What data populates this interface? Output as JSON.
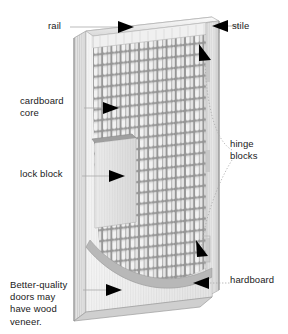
{
  "diagram": {
    "view": "three-quarter perspective cutaway"
  },
  "labels": {
    "rail": "rail",
    "stile": "stile",
    "cardboard_core": "cardboard\ncore",
    "lock_block": "lock block",
    "hinge_blocks": "hinge\nblocks",
    "hardboard": "hardboard",
    "veneer_note": "Better-quality\ndoors may\nhave wood\nveneer."
  },
  "colors": {
    "background": "#ffffff",
    "text": "#1a1a1a",
    "leader_line": "#a9a9a9",
    "arrow": "#000000",
    "face_light": "#f2f2f2",
    "face_mid": "#dcdcdc",
    "face_shadow": "#b9b9b9",
    "core_cell": "#ffffff",
    "core_gap": "#a8a8a8",
    "lock_block": "#d6d6d6",
    "hardboard_skin": "#ededed",
    "edge_dark": "#9a9a9a"
  },
  "parts": [
    {
      "name": "rail",
      "description": "horizontal top frame member"
    },
    {
      "name": "stile",
      "description": "vertical side frame member"
    },
    {
      "name": "cardboard core",
      "description": "honeycomb cardboard lattice filling door interior"
    },
    {
      "name": "lock block",
      "description": "solid block in stile for lockset"
    },
    {
      "name": "hinge blocks",
      "description": "solid blocks in stile for hinges"
    },
    {
      "name": "hardboard",
      "description": "thin skin facing peeled back to reveal core"
    },
    {
      "name": "veneer",
      "description": "optional wood veneer on better-quality doors"
    }
  ]
}
